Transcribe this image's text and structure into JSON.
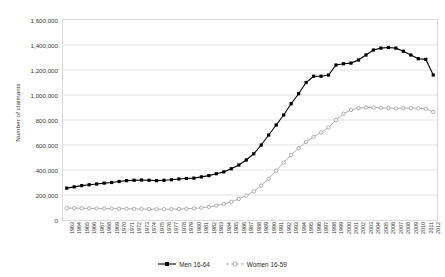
{
  "chart_data": {
    "type": "line",
    "title": "",
    "xlabel": "",
    "ylabel": "Number of claimants",
    "ylim": [
      0,
      1600000
    ],
    "ytick_step": 200000,
    "ytick_labels": [
      "1,600,000",
      "1,400,000",
      "1,200,000",
      "1,000,000",
      "800,000",
      "600,000",
      "400,000",
      "200,000",
      "0"
    ],
    "ytick_values": [
      1600000,
      1400000,
      1200000,
      1000000,
      800000,
      600000,
      400000,
      200000,
      0
    ],
    "grid": "horizontal",
    "legend_position": "bottom",
    "categories": [
      "1963",
      "1964",
      "1965",
      "1966",
      "1967",
      "1968",
      "1969",
      "1970",
      "1971",
      "1972",
      "1973",
      "1974",
      "1975",
      "1976",
      "1977",
      "1978",
      "1979",
      "1980",
      "1981",
      "1982",
      "1983",
      "1984",
      "1985",
      "1986",
      "1987",
      "1988",
      "1989",
      "1990",
      "1991",
      "1992",
      "1993",
      "1994",
      "1995",
      "1996",
      "1997",
      "1998",
      "1999",
      "2000",
      "2001",
      "2002",
      "2003",
      "2004",
      "2005",
      "2006",
      "2007",
      "2008",
      "2009",
      "2010",
      "2011",
      "2012"
    ],
    "series": [
      {
        "name": "Men 16-64",
        "color": "#000000",
        "marker": "filled-square",
        "values": [
          255000,
          265000,
          275000,
          282000,
          288000,
          295000,
          300000,
          308000,
          315000,
          318000,
          320000,
          318000,
          315000,
          318000,
          322000,
          328000,
          332000,
          335000,
          345000,
          355000,
          370000,
          385000,
          410000,
          440000,
          480000,
          530000,
          600000,
          680000,
          760000,
          840000,
          930000,
          1010000,
          1100000,
          1150000,
          1150000,
          1160000,
          1240000,
          1250000,
          1255000,
          1280000,
          1320000,
          1360000,
          1375000,
          1380000,
          1375000,
          1350000,
          1320000,
          1290000,
          1285000,
          1160000
        ]
      },
      {
        "name": "Women 16-59",
        "color": "#a6a6a6",
        "marker": "open-circle",
        "values": [
          95000,
          95000,
          94000,
          93000,
          92000,
          92000,
          91000,
          90000,
          90000,
          89000,
          88000,
          87000,
          86000,
          86000,
          87000,
          88000,
          90000,
          93000,
          98000,
          105000,
          115000,
          128000,
          145000,
          168000,
          195000,
          230000,
          275000,
          330000,
          395000,
          460000,
          520000,
          575000,
          625000,
          665000,
          700000,
          740000,
          800000,
          850000,
          880000,
          895000,
          900000,
          900000,
          898000,
          895000,
          893000,
          895000,
          895000,
          893000,
          890000,
          865000
        ]
      }
    ]
  },
  "legend": {
    "entries": [
      {
        "label": "Men 16-64"
      },
      {
        "label": "Women 16-59"
      }
    ]
  }
}
